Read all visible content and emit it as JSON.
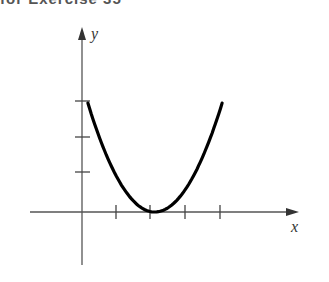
{
  "header": {
    "text": "for Exercise 35"
  },
  "chart_data": {
    "type": "line",
    "title": "",
    "xlabel": "x",
    "ylabel": "y",
    "x_ticks": [
      1,
      2,
      3,
      4
    ],
    "y_ticks": [
      1,
      2,
      3
    ],
    "tick_labels_shown": false,
    "grid": false,
    "legend": null,
    "series": [
      {
        "name": "parabola",
        "description": "upward-opening parabola, vertex near (2.1, 0), passing through (0.17, 3) and (4.05, 3)",
        "x": [
          0.17,
          0.5,
          1.0,
          1.5,
          2.1,
          2.5,
          3.0,
          3.5,
          4.05
        ],
        "values": [
          3.0,
          2.07,
          0.96,
          0.28,
          0.0,
          0.13,
          0.64,
          1.55,
          3.0
        ]
      }
    ],
    "xlim": [
      -0.3,
      6.3
    ],
    "ylim": [
      -1.5,
      5.0
    ]
  },
  "style": {
    "curve_color": "#000000",
    "axis_color": "#555555"
  }
}
